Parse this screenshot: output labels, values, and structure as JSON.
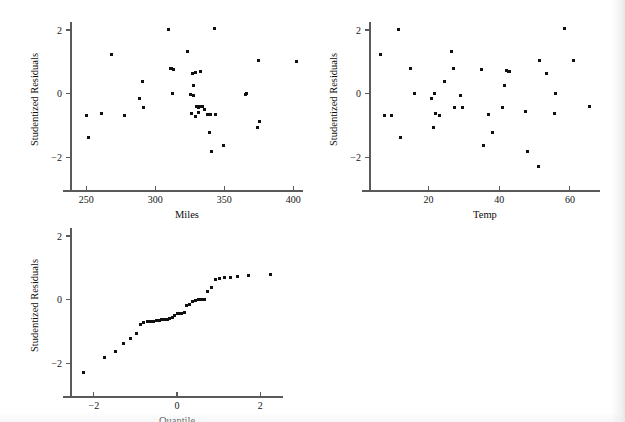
{
  "figure": {
    "background_color": "#ffffff",
    "point_color": "#101010",
    "axis_color": "#5a5a5a",
    "width": 625,
    "height": 422
  },
  "chart_data": [
    {
      "id": "residuals-vs-miles",
      "type": "scatter",
      "title": "",
      "xlabel": "Miles",
      "ylabel": "Studentized Residuals",
      "xlim": [
        239,
        407
      ],
      "ylim": [
        -2.62,
        2.25
      ],
      "xticks": [
        250,
        300,
        350,
        400
      ],
      "yticks": [
        -2,
        0,
        2
      ],
      "xticklabels": [
        "250",
        "300",
        "350",
        "400"
      ],
      "yticklabels": [
        "−2",
        "0",
        "2"
      ],
      "grid": false,
      "legend": null,
      "x": [
        250.5,
        252.0,
        261.0,
        268.0,
        278.0,
        288.5,
        291.0,
        291.5,
        309.5,
        311.0,
        311.5,
        312.5,
        313.0,
        323.0,
        325.5,
        326.0,
        327.0,
        327.5,
        328.0,
        329.0,
        329.5,
        330.0,
        331.0,
        331.5,
        332.0,
        332.5,
        334.0,
        336.0,
        338.0,
        339.5,
        340.0,
        341.0,
        343.0,
        343.5,
        349.5,
        365.0,
        366.0,
        374.0,
        375.0,
        375.5,
        402.0
      ],
      "y": [
        -0.68,
        -1.37,
        -0.62,
        1.22,
        -0.69,
        -0.16,
        0.39,
        -0.44,
        2.0,
        0.8,
        0.78,
        0.0,
        0.77,
        1.33,
        -0.02,
        -0.64,
        0.62,
        -0.07,
        0.26,
        0.66,
        -0.72,
        -0.41,
        -0.44,
        -0.59,
        -0.42,
        0.71,
        -0.39,
        -0.51,
        -0.67,
        -1.23,
        -0.65,
        -1.82,
        2.05,
        -0.66,
        -1.62,
        -0.03,
        0.0,
        -1.05,
        1.03,
        -0.88,
        1.0
      ]
    },
    {
      "id": "residuals-vs-temp",
      "type": "scatter",
      "title": "",
      "xlabel": "Temp",
      "ylabel": "Studentized Residuals",
      "xlim": [
        3.5,
        68.5
      ],
      "ylim": [
        -2.62,
        2.25
      ],
      "xticks": [
        20,
        40,
        60
      ],
      "yticks": [
        -2,
        0,
        2
      ],
      "xticklabels": [
        "20",
        "40",
        "60"
      ],
      "yticklabels": [
        "−2",
        "0",
        "2"
      ],
      "grid": false,
      "legend": null,
      "x": [
        6.5,
        7.5,
        9.5,
        11.5,
        12.0,
        15.0,
        16.0,
        21.0,
        21.5,
        21.8,
        22.0,
        23.0,
        24.5,
        26.5,
        27.0,
        27.5,
        29.0,
        29.5,
        35.0,
        35.5,
        37.0,
        38.0,
        41.0,
        41.5,
        42.0,
        42.5,
        43.0,
        47.5,
        48.0,
        51.0,
        51.5,
        53.5,
        55.5,
        56.0,
        58.5,
        61.0,
        65.5
      ],
      "y": [
        1.22,
        -0.68,
        -0.69,
        2.0,
        -1.37,
        0.79,
        0.0,
        -0.16,
        -1.05,
        0.0,
        -0.63,
        -0.7,
        0.39,
        1.33,
        0.8,
        -0.44,
        -0.07,
        -0.44,
        0.77,
        -1.62,
        -0.67,
        -1.23,
        -0.45,
        0.26,
        0.72,
        0.71,
        0.68,
        -0.55,
        -1.82,
        -2.3,
        1.03,
        0.62,
        -0.63,
        0.0,
        2.05,
        1.04,
        -0.4
      ]
    },
    {
      "id": "normal-qq-plot",
      "type": "scatter",
      "title": "",
      "xlabel": "Quantile",
      "ylabel": "Studentized Residuals",
      "xlim": [
        -2.55,
        2.55
      ],
      "ylim": [
        -2.62,
        2.25
      ],
      "xticks": [
        -2,
        0,
        2
      ],
      "yticks": [
        -2,
        0,
        2
      ],
      "xticklabels": [
        "−2",
        "0",
        "2"
      ],
      "yticklabels": [
        "−2",
        "0",
        "2"
      ],
      "grid": false,
      "legend": null,
      "x": [
        -2.25,
        -1.75,
        -1.48,
        -1.28,
        -1.12,
        -0.98,
        -0.88,
        -0.8,
        -0.72,
        -0.64,
        -0.57,
        -0.5,
        -0.43,
        -0.37,
        -0.3,
        -0.24,
        -0.18,
        -0.12,
        -0.06,
        0.0,
        0.06,
        0.12,
        0.18,
        0.24,
        0.31,
        0.37,
        0.44,
        0.51,
        0.58,
        0.66,
        0.74,
        0.82,
        0.92,
        1.02,
        1.14,
        1.28,
        1.45,
        1.72,
        2.25
      ],
      "y": [
        -2.3,
        -1.82,
        -1.62,
        -1.37,
        -1.23,
        -1.05,
        -0.78,
        -0.72,
        -0.7,
        -0.69,
        -0.68,
        -0.67,
        -0.66,
        -0.64,
        -0.63,
        -0.62,
        -0.59,
        -0.55,
        -0.51,
        -0.45,
        -0.44,
        -0.44,
        -0.41,
        -0.2,
        -0.16,
        -0.07,
        -0.03,
        0.0,
        0.0,
        0.0,
        0.26,
        0.39,
        0.62,
        0.66,
        0.68,
        0.71,
        0.72,
        0.77,
        0.79,
        0.8,
        1.0,
        1.03,
        1.04,
        1.22,
        1.33,
        2.0,
        2.05
      ]
    }
  ]
}
